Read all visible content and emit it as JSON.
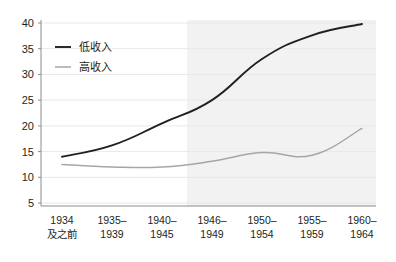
{
  "chart_data": {
    "type": "line",
    "title": "",
    "subtitle": "",
    "xlabel": "",
    "ylabel": "",
    "categories": [
      "1934及之前",
      "1935–1939",
      "1940–1945",
      "1946–1949",
      "1950–1954",
      "1955–1959",
      "1960–1964"
    ],
    "category_lines": [
      [
        "1934",
        "及之前"
      ],
      [
        "1935–",
        "1939"
      ],
      [
        "1940–",
        "1945"
      ],
      [
        "1946–",
        "1949"
      ],
      [
        "1950–",
        "1954"
      ],
      [
        "1955–",
        "1959"
      ],
      [
        "1960–",
        "1964"
      ]
    ],
    "series": [
      {
        "name": "低收入",
        "color": "#231f20",
        "values": [
          14.0,
          16.2,
          20.5,
          25.0,
          33.0,
          37.6,
          39.8
        ]
      },
      {
        "name": "高收入",
        "color": "#a6a6a6",
        "values": [
          12.5,
          12.0,
          12.0,
          13.1,
          14.8,
          14.3,
          19.5
        ]
      }
    ],
    "ylim": [
      5,
      40
    ],
    "yticks": [
      5,
      10,
      15,
      20,
      25,
      30,
      35,
      40
    ],
    "ytick_labels": [
      "5",
      "10",
      "15",
      "20",
      "25",
      "30",
      "35",
      "40"
    ],
    "grid": true,
    "grid_color": "#e8e8e8",
    "axis_color": "#b0b0b0",
    "legend_position": "top-left",
    "shaded_region": {
      "from_category": "1946–1949",
      "to_category": "1960–1964",
      "color": "#f2f2f2"
    },
    "background_color": "#ffffff"
  },
  "legend": {
    "entries": [
      {
        "label": "低收入",
        "color": "#231f20"
      },
      {
        "label": "高收入",
        "color": "#a6a6a6"
      }
    ]
  }
}
